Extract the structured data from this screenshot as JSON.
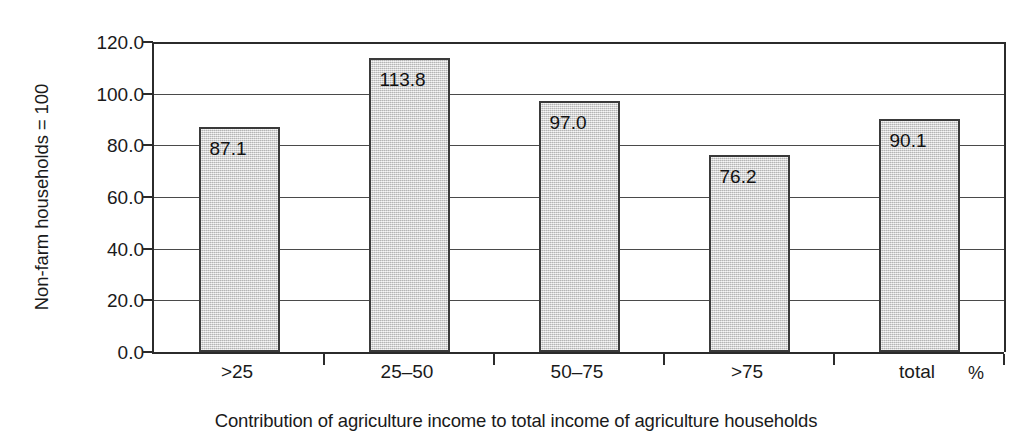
{
  "chart_data": {
    "type": "bar",
    "title": "",
    "subtitle": "",
    "categories": [
      ">25",
      "25–50",
      "50–75",
      ">75",
      "total"
    ],
    "values": [
      87.1,
      113.8,
      97.0,
      76.2,
      90.1
    ],
    "value_labels": [
      "87.1",
      "113.8",
      "97.0",
      "76.2",
      "90.1"
    ],
    "series": [
      {
        "name": "Non-farm households = 100",
        "values": [
          87.1,
          113.8,
          97.0,
          76.2,
          90.1
        ]
      }
    ],
    "xlabel": "Contribution of agriculture income to total income of agriculture households",
    "ylabel": "Non-farm households = 100",
    "x_unit": "%",
    "ylim": [
      0.0,
      120.0
    ],
    "ytick_values": [
      0.0,
      20.0,
      40.0,
      60.0,
      80.0,
      100.0,
      120.0
    ],
    "ytick_labels": [
      "0.0",
      "20.0",
      "40.0",
      "60.0",
      "80.0",
      "100.0",
      "120.0"
    ],
    "grid": "horizontal",
    "legend": "none",
    "bar_fill_color": "#d4d4d4",
    "bar_border_color": "#3a3a3a",
    "axis_color": "#2b2b2b",
    "gridline_color": "#4a4a4a",
    "text_color": "#1a1a1a",
    "background_color": "#ffffff"
  },
  "axes": {
    "y_title": "Non-farm households = 100",
    "x_caption": "Contribution of agriculture income to total income of agriculture households",
    "x_unit": "%"
  }
}
